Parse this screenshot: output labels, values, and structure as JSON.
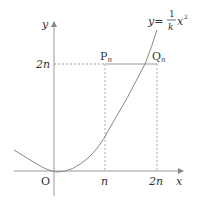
{
  "diagram": {
    "axes": {
      "x_label": "x",
      "y_label": "y",
      "origin_label": "O"
    },
    "ticks": {
      "x_n": "n",
      "x_2n": "2n",
      "y_2n": "2n"
    },
    "points": {
      "P": "P",
      "P_sub": "n",
      "Q": "Q",
      "Q_sub": "n"
    },
    "curve_label": {
      "lhs": "y=",
      "num": "1",
      "den": "k",
      "var": "x",
      "exp": "2"
    },
    "colors": {
      "line": "#888888",
      "text": "#333333",
      "dotted": "#999999"
    }
  }
}
